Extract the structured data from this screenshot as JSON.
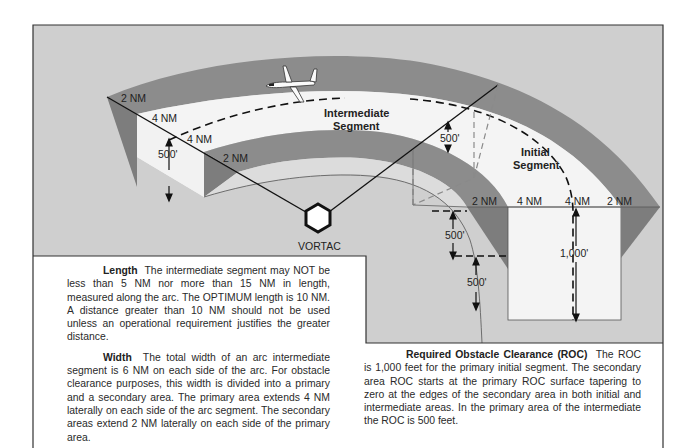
{
  "diagram": {
    "labels": {
      "left_outer_secondary": "2 NM",
      "left_outer_primary": "4 NM",
      "left_inner_primary": "4 NM",
      "left_inner_secondary": "2 NM",
      "left_height": "500'",
      "mid_height": "500'",
      "right_secondary_1": "2 NM",
      "right_primary_1": "4 NM",
      "right_primary_2": "4 NM",
      "right_secondary_2": "2 NM",
      "right_taper_upper": "500'",
      "right_taper_lower": "500'",
      "right_primary_height": "1,000'",
      "intermediate_segment_line1": "Intermediate",
      "intermediate_segment_line2": "Segment",
      "initial_segment_line1": "Initial",
      "initial_segment_line2": "Segment",
      "navaid": "VORTAC"
    },
    "icons": [
      "aircraft-icon",
      "vortac-hexagon-icon"
    ],
    "colors": {
      "background": "#cfcfcf",
      "secondary_area": "#8c8c8c",
      "primary_area": "#f4f4f4",
      "side_wall": "#e6e6e6",
      "border": "#333333"
    }
  },
  "text": {
    "length": {
      "heading": "Length",
      "body": "The intermediate segment may NOT be less than 5 NM nor more than 15 NM in length, measured along the arc. The OPTIMUM length is 10 NM. A distance greater than 10 NM should not be used unless an operational requirement justifies the greater distance."
    },
    "width": {
      "heading": "Width",
      "body": "The total width of an arc intermediate segment is 6 NM on each side of the arc. For obstacle clearance purposes, this width is divided into a primary and a secondary area. The primary area extends 4 NM laterally on each side of the arc segment. The secondary areas extend 2 NM laterally on each side of the primary area."
    },
    "roc": {
      "heading": "Required Obstacle Clearance (ROC)",
      "body": "The ROC is 1,000 feet for the primary initial segment. The secondary area ROC starts at the primary ROC surface tapering to zero at the edges of the secondary area in both initial and intermediate areas. In the primary area of the intermediate the ROC is 500 feet."
    }
  }
}
